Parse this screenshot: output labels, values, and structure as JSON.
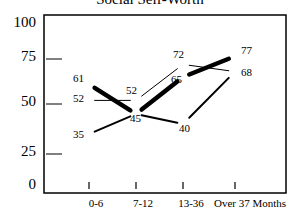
{
  "chart_data": {
    "type": "line",
    "title": "Social Self-Worth",
    "xlabel": "",
    "ylabel": "",
    "ylim": [
      0,
      100
    ],
    "yticks": [
      0,
      25,
      50,
      75,
      100
    ],
    "categories": [
      "0-6",
      "7-12",
      "13-36",
      "Over 37 Months"
    ],
    "grid": false,
    "legend": "none",
    "series": [
      {
        "name": "Series 1 (thick)",
        "values": [
          61,
          45,
          65,
          77
        ],
        "labels": [
          "61",
          "45",
          "65",
          "77"
        ]
      },
      {
        "name": "Series 2 (thin)",
        "values": [
          52,
          52,
          72,
          68
        ],
        "labels": [
          "52",
          "52",
          "72",
          "68"
        ]
      },
      {
        "name": "Series 3 (medium)",
        "values": [
          35,
          45,
          40,
          68
        ],
        "labels": [
          "35",
          "45",
          "40",
          "68"
        ]
      }
    ]
  },
  "labels": {
    "title": "Social Self-Worth",
    "y": [
      "100",
      "75",
      "50",
      "25",
      "0"
    ],
    "x": [
      "0-6",
      "7-12",
      "13-36",
      "Over 37 Months"
    ]
  }
}
